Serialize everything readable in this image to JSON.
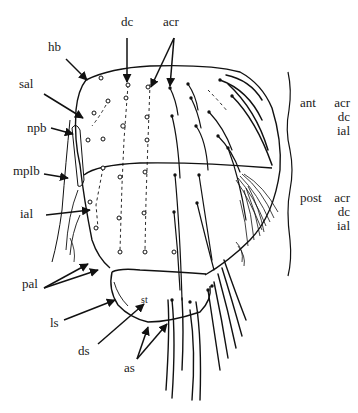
{
  "figure": {
    "background": "#ffffff",
    "ink_color": "#111111"
  },
  "labels": {
    "dc": "dc",
    "acr": "acr",
    "hb": "hb",
    "sal": "sal",
    "npb": "npb",
    "mplb": "mplb",
    "ial": "ial",
    "pal": "pal",
    "ls": "ls",
    "ds": "ds",
    "st": "st",
    "as": "as"
  },
  "legend": {
    "anterior": {
      "prefix": "ant",
      "items": [
        "acr",
        "dc",
        "ial"
      ]
    },
    "posterior": {
      "prefix": "post",
      "items": [
        "acr",
        "dc",
        "ial"
      ]
    }
  }
}
